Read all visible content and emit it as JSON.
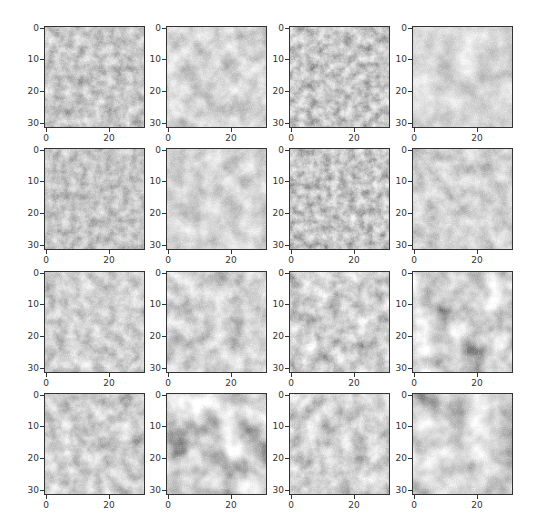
{
  "chart_data": {
    "type": "heatmap",
    "title": "",
    "layout": {
      "rows": 4,
      "cols": 4
    },
    "image_size": [
      32,
      32
    ],
    "xlabel": "",
    "ylabel": "",
    "xticks": [
      0,
      20
    ],
    "yticks": [
      0,
      10,
      20,
      30
    ],
    "xlim": [
      -0.5,
      31.5
    ],
    "ylim": [
      31.5,
      -0.5
    ],
    "grid": false,
    "legend": null,
    "panels": [
      {
        "row": 0,
        "col": 0,
        "mean_gray": "#8c8c8c",
        "contrast": 0.35,
        "seed": 3,
        "freq": 0.22,
        "pattern": "fine dark speckle blobs"
      },
      {
        "row": 0,
        "col": 1,
        "mean_gray": "#a3a3a3",
        "contrast": 0.4,
        "seed": 7,
        "freq": 0.12,
        "pattern": "soft diagonal light/dark bands"
      },
      {
        "row": 0,
        "col": 2,
        "mean_gray": "#8e8e8e",
        "contrast": 0.4,
        "seed": 11,
        "freq": 0.24,
        "pattern": "dark speckle blobs"
      },
      {
        "row": 0,
        "col": 3,
        "mean_gray": "#a8a8a8",
        "contrast": 0.35,
        "seed": 13,
        "freq": 0.1,
        "pattern": "light smooth, faint diagonal streak"
      },
      {
        "row": 1,
        "col": 0,
        "mean_gray": "#8a8a8a",
        "contrast": 0.3,
        "seed": 17,
        "freq": 0.25,
        "pattern": "uniform fine speckle"
      },
      {
        "row": 1,
        "col": 1,
        "mean_gray": "#a2a2a2",
        "contrast": 0.35,
        "seed": 19,
        "freq": 0.12,
        "pattern": "light, faint diagonal band"
      },
      {
        "row": 1,
        "col": 2,
        "mean_gray": "#8a8a8a",
        "contrast": 0.4,
        "seed": 23,
        "freq": 0.26,
        "pattern": "dark star-like speckles"
      },
      {
        "row": 1,
        "col": 3,
        "mean_gray": "#a0a0a0",
        "contrast": 0.3,
        "seed": 29,
        "freq": 0.16,
        "pattern": "light uniform"
      },
      {
        "row": 2,
        "col": 0,
        "mean_gray": "#9c9c9c",
        "contrast": 0.35,
        "seed": 31,
        "freq": 0.18,
        "pattern": "medium mottled"
      },
      {
        "row": 2,
        "col": 1,
        "mean_gray": "#a0a0a0",
        "contrast": 0.35,
        "seed": 37,
        "freq": 0.14,
        "pattern": "light mottled"
      },
      {
        "row": 2,
        "col": 2,
        "mean_gray": "#999999",
        "contrast": 0.45,
        "seed": 41,
        "freq": 0.16,
        "pattern": "mottled blobs"
      },
      {
        "row": 2,
        "col": 3,
        "mean_gray": "#9a9a9a",
        "contrast": 0.6,
        "seed": 43,
        "freq": 0.09,
        "pattern": "strong diagonal dark streaks"
      },
      {
        "row": 3,
        "col": 0,
        "mean_gray": "#9a9a9a",
        "contrast": 0.4,
        "seed": 47,
        "freq": 0.15,
        "pattern": "mottled, dark spot lower right"
      },
      {
        "row": 3,
        "col": 1,
        "mean_gray": "#9c9c9c",
        "contrast": 0.65,
        "seed": 53,
        "freq": 0.08,
        "pattern": "strong diagonal bands, dark lower right"
      },
      {
        "row": 3,
        "col": 2,
        "mean_gray": "#9e9e9e",
        "contrast": 0.4,
        "seed": 59,
        "freq": 0.14,
        "pattern": "mottled, dark spot center"
      },
      {
        "row": 3,
        "col": 3,
        "mean_gray": "#a8a8a8",
        "contrast": 0.55,
        "seed": 61,
        "freq": 0.08,
        "pattern": "light with dark diagonal streak center"
      }
    ]
  },
  "axes_labels": {
    "y": [
      "0",
      "10",
      "20",
      "30"
    ],
    "x": [
      "0",
      "20"
    ]
  }
}
